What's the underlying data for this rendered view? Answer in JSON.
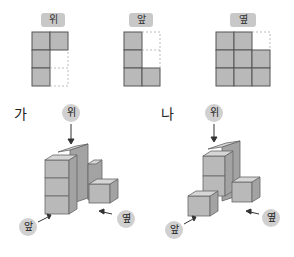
{
  "views": [
    {
      "label": "위",
      "name": "top-view"
    },
    {
      "label": "앞",
      "name": "front-view"
    },
    {
      "label": "옆",
      "name": "side-view"
    }
  ],
  "figures": [
    {
      "label": "가",
      "top": "위",
      "front": "앞",
      "side": "옆"
    },
    {
      "label": "나",
      "top": "위",
      "front": "앞",
      "side": "옆"
    }
  ],
  "colors": {
    "cube_fill": "#b9b9b9",
    "cube_top": "#d6d6d6",
    "cube_side": "#a3a3a3",
    "grid_line": "#555555",
    "label_bg": "#c8c8c8"
  }
}
